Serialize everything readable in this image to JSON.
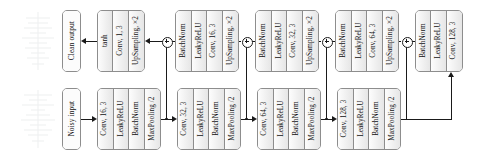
{
  "diagram": {
    "io": {
      "input_label": "Noisy input",
      "output_label": "Clean output"
    },
    "junction_symbol": "⊕",
    "colors": {
      "block_fill": "#f0f0f0",
      "block_border": "#8d8d8d",
      "line": "#1a1a1a",
      "canvas": "#ffffff"
    },
    "encoder_blocks": [
      {
        "name": "encoder-block-1",
        "cells": [
          "Conv, 16, 3",
          "LeakyReLU",
          "BatchNorm",
          "MaxPooling /2"
        ]
      },
      {
        "name": "encoder-block-2",
        "cells": [
          "Conv, 32, 3",
          "LeakyReLU",
          "BatchNorm",
          "MaxPooling /2"
        ]
      },
      {
        "name": "encoder-block-3",
        "cells": [
          "Conv, 64, 3",
          "LeakyReLU",
          "BatchNorm",
          "MaxPooling /2"
        ]
      },
      {
        "name": "encoder-block-4",
        "cells": [
          "Conv, 128, 3",
          "LeakyReLU",
          "BatchNorm",
          "MaxPooling /2"
        ]
      }
    ],
    "decoder_blocks": [
      {
        "name": "decoder-block-output",
        "cells": [
          "tanh",
          "Conv, 1, 3",
          "UpSampling, ×2"
        ]
      },
      {
        "name": "decoder-block-1",
        "cells": [
          "BatchNorm",
          "LeakyReLU",
          "Conv, 16, 3",
          "UpSampling, ×2"
        ]
      },
      {
        "name": "decoder-block-2",
        "cells": [
          "BatchNorm",
          "LeakyReLU",
          "Conv, 32, 3",
          "UpSampling, ×2"
        ]
      },
      {
        "name": "decoder-block-3",
        "cells": [
          "BatchNorm",
          "LeakyReLU",
          "Conv, 64, 3",
          "UpSampling, ×2"
        ]
      },
      {
        "name": "decoder-block-bottleneck",
        "cells": [
          "BatchNorm",
          "LeakyReLU",
          "Conv, 128, 3"
        ]
      }
    ]
  }
}
